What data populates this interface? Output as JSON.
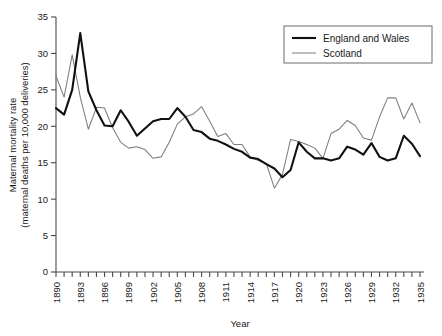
{
  "chart_data": {
    "type": "line",
    "title": "",
    "xlabel": "Year",
    "ylabel": "Maternal mortality rate (maternal deaths per 10,000 deliveries)",
    "ylabel_line1": "Maternal mortality rate",
    "ylabel_line2": "(maternal deaths per 10,000 deliveries)",
    "xlim": [
      1890,
      1935
    ],
    "ylim": [
      0,
      35
    ],
    "ytick_step": 5,
    "xtick_step": 1,
    "xlabel_step": 3,
    "grid": false,
    "legend_position": "top-right",
    "yticks": [
      0,
      5,
      10,
      15,
      20,
      25,
      30,
      35
    ],
    "ytick_labels": [
      "0",
      "5",
      "10",
      "15",
      "20",
      "25",
      "30",
      "35"
    ],
    "x": [
      1890,
      1891,
      1892,
      1893,
      1894,
      1895,
      1896,
      1897,
      1898,
      1899,
      1900,
      1901,
      1902,
      1903,
      1904,
      1905,
      1906,
      1907,
      1908,
      1909,
      1910,
      1911,
      1912,
      1913,
      1914,
      1915,
      1916,
      1917,
      1918,
      1919,
      1920,
      1921,
      1922,
      1923,
      1924,
      1925,
      1926,
      1927,
      1928,
      1929,
      1930,
      1931,
      1932,
      1933,
      1934,
      1935
    ],
    "xtick_labels": [
      "1890",
      "1893",
      "1896",
      "1899",
      "1902",
      "1905",
      "1908",
      "1911",
      "1914",
      "1917",
      "1920",
      "1923",
      "1926",
      "1929",
      "1932",
      "1935"
    ],
    "xtick_label_years": [
      1890,
      1893,
      1896,
      1899,
      1902,
      1905,
      1908,
      1911,
      1914,
      1917,
      1920,
      1923,
      1926,
      1929,
      1932,
      1935
    ],
    "series": [
      {
        "name": "England and Wales",
        "color": "#111111",
        "linewidth": 2.1,
        "values": [
          22.5,
          21.6,
          25.0,
          32.8,
          24.8,
          22.2,
          20.1,
          20.0,
          22.2,
          20.6,
          18.7,
          19.7,
          20.7,
          21.0,
          21.0,
          22.5,
          21.3,
          19.5,
          19.2,
          18.3,
          18.0,
          17.5,
          16.9,
          16.5,
          15.7,
          15.5,
          14.8,
          14.2,
          13.0,
          14.0,
          17.8,
          16.5,
          15.6,
          15.6,
          15.3,
          15.6,
          17.2,
          16.8,
          16.1,
          17.7,
          15.8,
          15.3,
          15.6,
          18.7,
          17.6,
          15.9
        ]
      },
      {
        "name": "Scotland",
        "color": "#7d7d7d",
        "linewidth": 1.05,
        "values": [
          26.9,
          24.0,
          29.8,
          24.0,
          19.6,
          22.6,
          22.5,
          19.8,
          17.8,
          17.0,
          17.2,
          16.8,
          15.6,
          15.8,
          17.8,
          20.3,
          21.3,
          21.7,
          22.7,
          20.7,
          18.6,
          19.0,
          17.5,
          17.5,
          15.8,
          15.3,
          14.9,
          11.5,
          13.4,
          18.2,
          17.9,
          17.5,
          17.0,
          15.6,
          19.0,
          19.6,
          20.8,
          20.1,
          18.4,
          18.1,
          21.3,
          23.9,
          23.9,
          21.0,
          23.2,
          20.5
        ]
      }
    ]
  },
  "legend": {
    "entries": [
      {
        "label": "England and Wales",
        "style": "thick-black"
      },
      {
        "label": "Scotland",
        "style": "thin-gray"
      }
    ]
  }
}
